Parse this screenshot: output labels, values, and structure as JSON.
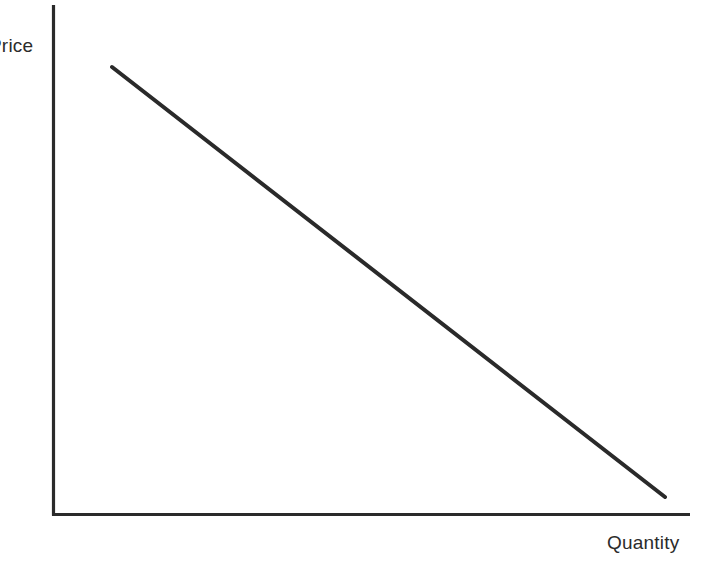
{
  "figure": {
    "width": 707,
    "height": 566,
    "background_color": "#ffffff",
    "ink_color": "#2a2a2a"
  },
  "axes": {
    "y_axis_label": "Price",
    "x_axis_label": "Quantity",
    "y_axis_label_visible_text": "rice",
    "origin": {
      "x": 53,
      "y": 514
    }
  },
  "chart_data": {
    "type": "line",
    "title": "",
    "subtitle": "",
    "xlabel": "Quantity",
    "ylabel": "Price",
    "xlim": [
      0,
      100
    ],
    "ylim": [
      0,
      100
    ],
    "grid": false,
    "legend": null,
    "axis_ticks": {
      "x": [],
      "y": []
    },
    "annotations": [],
    "series": [
      {
        "name": "Demand",
        "label_shown": false,
        "color": "#2a2a2a",
        "line_width": 4,
        "x": [
          10.5,
          100.0
        ],
        "y": [
          96.5,
          3.3
        ],
        "pixel_points": [
          {
            "x": 112,
            "y": 67
          },
          {
            "x": 665,
            "y": 497
          }
        ],
        "slope_pixels": -0.777,
        "description": "Downward sloping straight demand curve"
      }
    ]
  }
}
